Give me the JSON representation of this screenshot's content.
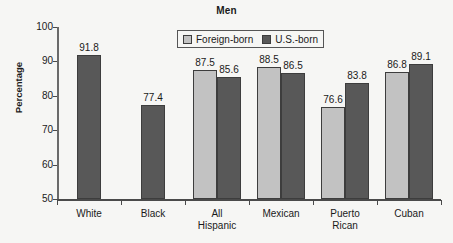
{
  "chart_data": {
    "type": "bar",
    "title": "Men",
    "xlabel": "",
    "ylabel": "Percentage",
    "ylim": [
      50,
      100
    ],
    "yticks": [
      "50",
      "60",
      "70",
      "80",
      "90",
      "100"
    ],
    "grid": false,
    "legend_position": "top-center",
    "categories": [
      "White",
      "Black",
      "All Hispanic",
      "Mexican",
      "Puerto Rican",
      "Cuban"
    ],
    "category_lines": [
      [
        "White"
      ],
      [
        "Black"
      ],
      [
        "All",
        "Hispanic"
      ],
      [
        "Mexican"
      ],
      [
        "Puerto",
        "Rican"
      ],
      [
        "Cuban"
      ]
    ],
    "series": [
      {
        "name": "Foreign-born",
        "color": "#c2c2c2",
        "values": [
          null,
          null,
          87.5,
          88.5,
          76.6,
          86.8
        ],
        "labels": [
          "",
          "",
          "87.5",
          "88.5",
          "76.6",
          "86.8"
        ]
      },
      {
        "name": "U.S.-born",
        "color": "#585858",
        "values": [
          91.8,
          77.4,
          85.6,
          86.5,
          83.8,
          89.1
        ],
        "labels": [
          "91.8",
          "77.4",
          "85.6",
          "86.5",
          "83.8",
          "89.1"
        ]
      }
    ]
  },
  "legend": {
    "items": [
      {
        "label": "Foreign-born",
        "swatch": "foreign"
      },
      {
        "label": "U.S.-born",
        "swatch": "usborn"
      }
    ]
  }
}
